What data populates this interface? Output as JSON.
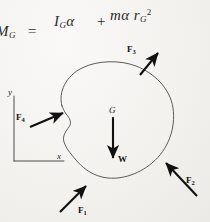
{
  "page": {
    "kind": "handwritten-freebody-diagram",
    "background_color": "#f2f1ee",
    "ink_color": "#1a1a1a"
  },
  "equation": {
    "lhs": "M",
    "lhs_sub": "G",
    "equals": "=",
    "term1": "I",
    "term1_sub": "G",
    "term1_factor": "α",
    "plus": "+",
    "term2": "mα r",
    "term2_sub": "G",
    "term2_sup": "2",
    "full_text": "M_G = I_G α + mα r_G^2"
  },
  "diagram": {
    "body_label": "rigid-body-outline",
    "center_of_gravity": {
      "label": "G"
    },
    "weight": {
      "label": "W"
    },
    "axes": {
      "x_label": "x",
      "y_label": "y"
    },
    "forces": [
      {
        "name": "F1",
        "label": "F",
        "sub": "1",
        "direction": "up-right"
      },
      {
        "name": "F2",
        "label": "F",
        "sub": "2",
        "direction": "up-left"
      },
      {
        "name": "F3",
        "label": "F",
        "sub": "3",
        "direction": "up-right"
      },
      {
        "name": "F4",
        "label": "F",
        "sub": "4",
        "direction": "right-up"
      }
    ]
  }
}
